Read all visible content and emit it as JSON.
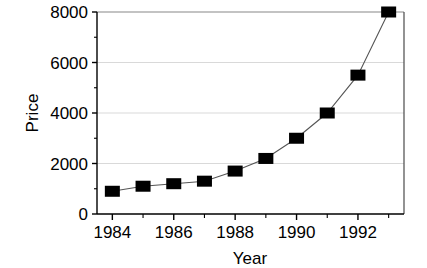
{
  "chart_data": {
    "type": "line",
    "title": "",
    "xlabel": "Year",
    "ylabel": "Price",
    "x": [
      1984,
      1985,
      1986,
      1987,
      1988,
      1989,
      1990,
      1991,
      1992,
      1993
    ],
    "values": [
      900,
      1100,
      1200,
      1300,
      1700,
      2200,
      3000,
      4000,
      5500,
      8000
    ],
    "series": [
      {
        "name": "Price",
        "values": [
          900,
          1100,
          1200,
          1300,
          1700,
          2200,
          3000,
          4000,
          5500,
          8000
        ]
      }
    ],
    "xlim": [
      1983.5,
      1993.5
    ],
    "ylim": [
      0,
      8000
    ],
    "xticks": [
      1984,
      1985,
      1986,
      1987,
      1988,
      1989,
      1990,
      1991,
      1992,
      1993
    ],
    "xtick_labels": [
      "1984",
      "",
      "1986",
      "",
      "1988",
      "",
      "1990",
      "",
      "1992",
      ""
    ],
    "yticks": [
      0,
      2000,
      4000,
      6000,
      8000
    ],
    "ytick_labels": [
      "0",
      "2000",
      "4000",
      "6000",
      "8000"
    ],
    "y_minor_ticks": [
      1000,
      3000,
      5000,
      7000
    ],
    "grid": "horizontal",
    "legend": "none",
    "marker": "filled-square",
    "marker_color": "#000000",
    "line_color": "#555555",
    "grid_color": "#d9d9d9",
    "axis_color": "#000000",
    "background_color": "#ffffff"
  },
  "axes": {
    "y_label_text": "Price",
    "x_label_text": "Year"
  }
}
